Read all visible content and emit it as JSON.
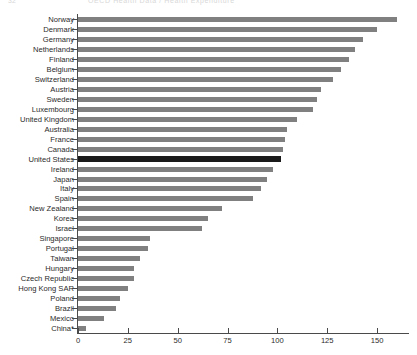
{
  "page_header": {
    "number": "32",
    "title": "OECD Health Data / Health Expenditure"
  },
  "chart_data": {
    "type": "bar",
    "orientation": "horizontal",
    "title": "",
    "xlabel": "",
    "ylabel": "",
    "xlim": [
      0,
      166
    ],
    "ylim": null,
    "grid": false,
    "legend": null,
    "axis_ticks": [
      0,
      25,
      50,
      75,
      100,
      125,
      150
    ],
    "tick_labels": [
      "0",
      "25",
      "50",
      "75",
      "100",
      "125",
      "150"
    ],
    "bar_color": "#808080",
    "highlight_color": "#1a1a1a",
    "highlight_category": "United States",
    "categories": [
      "Norway",
      "Denmark",
      "Germany",
      "Netherlands",
      "Finland",
      "Belgium",
      "Switzerland",
      "Austria",
      "Sweden",
      "Luxembourg",
      "United Kingdom",
      "Australia",
      "France",
      "Canada",
      "United States",
      "Ireland",
      "Japan",
      "Italy",
      "Spain",
      "New Zealand",
      "Korea",
      "Israel",
      "Singapore",
      "Portugal",
      "Taiwan",
      "Hungary",
      "Czech Republic",
      "Hong Kong SAR",
      "Poland",
      "Brazil",
      "Mexico",
      "China*"
    ],
    "values": [
      160,
      150,
      143,
      139,
      136,
      132,
      128,
      122,
      120,
      118,
      110,
      105,
      104,
      103,
      102,
      98,
      95,
      92,
      88,
      72,
      65,
      62,
      36,
      35,
      31,
      28,
      28,
      25,
      21,
      19,
      13,
      4
    ]
  }
}
